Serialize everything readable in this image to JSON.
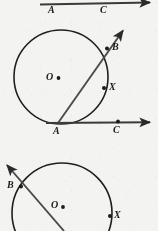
{
  "figure": {
    "kind": "geometry-diagram",
    "background_color": "#f3f3f1",
    "ink_color": "#1f1f1f",
    "canvas": {
      "width": 158,
      "height": 231
    }
  },
  "panels": [
    {
      "id": "panel-top",
      "name": "top-figure-cropped",
      "note": "Only the bottom edge of the preceding figure is visible: a horizontal ray with two labeled points.",
      "ray": {
        "x1": 40,
        "y1": 4,
        "x2": 152,
        "y2": 2,
        "arrow_end": "right"
      },
      "points": [
        {
          "label": "A",
          "cx": 54,
          "cy": 3,
          "label_x": 48,
          "label_y": 6,
          "dot": false
        },
        {
          "label": "C",
          "cx": 106,
          "cy": 3,
          "label_x": 100,
          "label_y": 6,
          "dot": false
        }
      ]
    },
    {
      "id": "panel-middle",
      "name": "main-figure",
      "circle": {
        "cx": 61,
        "cy": 77,
        "r": 47
      },
      "center": {
        "label": "O",
        "cx": 58,
        "cy": 78,
        "label_x": 46,
        "label_y": 72,
        "dot": true
      },
      "secant": {
        "name": "ray-A-through-B",
        "x1": 58,
        "y1": 123,
        "x2": 126,
        "y2": 27,
        "arrow_end": "upper-right"
      },
      "base_ray": {
        "name": "ray-A-through-C",
        "x1": 46,
        "y1": 123,
        "x2": 154,
        "y2": 122,
        "arrow_end": "right"
      },
      "points": [
        {
          "label": "B",
          "cx": 107,
          "cy": 48,
          "label_x": 112,
          "label_y": 43,
          "dot": true
        },
        {
          "label": "X",
          "cx": 104,
          "cy": 88,
          "label_x": 109,
          "label_y": 83,
          "dot": true
        },
        {
          "label": "A",
          "cx": 58,
          "cy": 123,
          "label_x": 53,
          "label_y": 127,
          "dot": false
        },
        {
          "label": "C",
          "cx": 118,
          "cy": 122,
          "label_x": 113,
          "label_y": 126,
          "dot": true
        }
      ]
    },
    {
      "id": "panel-bottom",
      "name": "bottom-figure-cropped",
      "note": "Next figure, cut off by the bottom edge of the crop.",
      "circle": {
        "cx": 62,
        "cy": 213,
        "r": 50
      },
      "center": {
        "label": "O",
        "cx": 63,
        "cy": 207,
        "label_x": 51,
        "label_y": 201,
        "dot": true
      },
      "secant": {
        "name": "ray-through-B",
        "x1": 62,
        "y1": 231,
        "x2": 5,
        "y2": 163,
        "arrow_end": "upper-left"
      },
      "points": [
        {
          "label": "B",
          "cx": 21,
          "cy": 186,
          "label_x": 8,
          "label_y": 181,
          "dot": true
        },
        {
          "label": "X",
          "cx": 110,
          "cy": 216,
          "label_x": 114,
          "label_y": 211,
          "dot": true
        }
      ]
    }
  ],
  "labels": {
    "font_size_px": 10
  }
}
